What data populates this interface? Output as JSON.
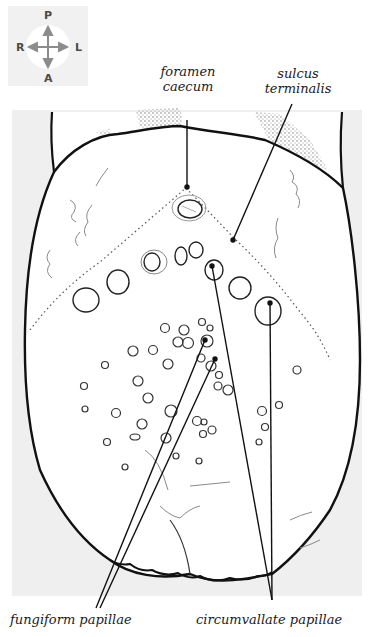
{
  "figure": {
    "colors": {
      "background_panel": "#efefef",
      "outline": "#111111",
      "faint_line": "#8a8a8a",
      "compass_bg": "#f1f1f1",
      "compass_arrow": "#8c8c8c"
    }
  },
  "compass": {
    "top": "P",
    "bottom": "A",
    "left": "R",
    "right": "L"
  },
  "labels": {
    "foramen_caecum": {
      "line1": "foramen",
      "line2": "caecum"
    },
    "sulcus_terminalis": {
      "line1": "sulcus",
      "line2": "terminalis"
    },
    "fungiform_papillae": "fungiform papillae",
    "circumvallate_papillae": "circumvallate papillae"
  }
}
